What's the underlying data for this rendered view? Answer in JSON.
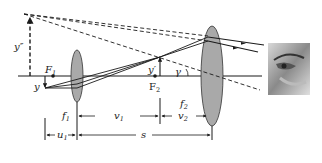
{
  "diagram": {
    "type": "compound-microscope-ray-diagram",
    "colors": {
      "line": "#1a1a1a",
      "lens_fill": "#a9a9a9",
      "lens_stroke": "#333333",
      "background": "#ffffff"
    },
    "labels": {
      "final_image": "y″",
      "object": "y",
      "intermediate_image": "y′",
      "focal_point_1": "F",
      "focal_point_1_sub": "1",
      "focal_point_2": "F",
      "focal_point_2_sub": "2",
      "angle": "γ",
      "f1": "f",
      "f1_sub": "1",
      "f2": "f",
      "f2_sub": "2",
      "v1": "v",
      "v1_sub": "1",
      "v2": "v",
      "v2_sub": "2",
      "u1": "u",
      "u1_sub": "1",
      "s": "s"
    },
    "elements": {
      "objective_lens": "objective",
      "eyepiece_lens": "eyepiece",
      "eye": "observer-eye"
    }
  }
}
